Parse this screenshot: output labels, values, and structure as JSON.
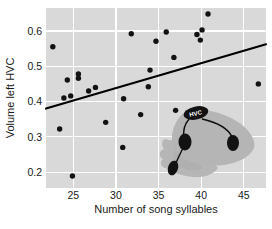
{
  "chart_data": {
    "type": "scatter",
    "title": "",
    "xlabel": "Number of song syllables",
    "ylabel": "Volume left HVC",
    "xlim": [
      21.8,
      47.6
    ],
    "ylim": [
      0.155,
      0.665
    ],
    "xticks": [
      25,
      30,
      35,
      40,
      45
    ],
    "yticks": [
      0.2,
      0.3,
      0.4,
      0.5,
      0.6
    ],
    "xtick_labels": [
      "25",
      "30",
      "35",
      "40",
      "45"
    ],
    "ytick_labels": [
      "0.2",
      "0.3",
      "0.4",
      "0.5",
      "0.6"
    ],
    "grid": true,
    "grid_color": "#ffffff",
    "plot_background": "#d9d9d9",
    "point_color": "#121212",
    "line_color": "#000000",
    "legend": "none",
    "points": [
      {
        "x": 22.6,
        "y": 0.555
      },
      {
        "x": 23.4,
        "y": 0.322
      },
      {
        "x": 23.9,
        "y": 0.41
      },
      {
        "x": 24.3,
        "y": 0.461
      },
      {
        "x": 24.7,
        "y": 0.416
      },
      {
        "x": 24.9,
        "y": 0.189
      },
      {
        "x": 25.6,
        "y": 0.478
      },
      {
        "x": 25.6,
        "y": 0.466
      },
      {
        "x": 26.8,
        "y": 0.43
      },
      {
        "x": 27.6,
        "y": 0.44
      },
      {
        "x": 28.8,
        "y": 0.341
      },
      {
        "x": 30.8,
        "y": 0.27
      },
      {
        "x": 30.9,
        "y": 0.408
      },
      {
        "x": 31.8,
        "y": 0.592
      },
      {
        "x": 32.9,
        "y": 0.363
      },
      {
        "x": 33.8,
        "y": 0.442
      },
      {
        "x": 34.0,
        "y": 0.489
      },
      {
        "x": 34.7,
        "y": 0.571
      },
      {
        "x": 35.9,
        "y": 0.597
      },
      {
        "x": 36.8,
        "y": 0.525
      },
      {
        "x": 37.0,
        "y": 0.375
      },
      {
        "x": 39.5,
        "y": 0.59
      },
      {
        "x": 39.9,
        "y": 0.574
      },
      {
        "x": 40.1,
        "y": 0.603
      },
      {
        "x": 40.8,
        "y": 0.648
      },
      {
        "x": 46.7,
        "y": 0.45
      }
    ],
    "regression_line": {
      "x_start": 21.8,
      "y_start": 0.38,
      "x_end": 47.6,
      "y_end": 0.562
    },
    "inset": {
      "label": "HVC",
      "description": "songbird-brain-diagram"
    }
  }
}
